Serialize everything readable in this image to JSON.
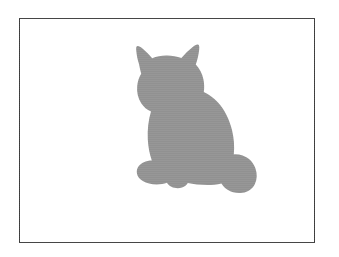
{
  "figure": {
    "width": 339,
    "height": 257,
    "background_color": "#ffffff",
    "caption": ""
  },
  "frame": {
    "name": "image-border",
    "x": 19,
    "y": 18,
    "width": 296,
    "height": 225,
    "border_color": "#3b3b3b",
    "border_width": 1,
    "fill_color": "#ffffff"
  },
  "subject": {
    "label": "cat-silhouette",
    "description": "sitting cat facing left",
    "fill_color": "#919191",
    "bbox": {
      "x": 129,
      "y": 62,
      "width": 98,
      "height": 126
    },
    "parts": [
      "left-ear",
      "right-ear",
      "head",
      "cheek",
      "chest",
      "back",
      "haunch",
      "front-paws",
      "tail"
    ]
  },
  "chart_data": {
    "type": "image",
    "title": "",
    "xlabel": "",
    "ylabel": "",
    "annotations": []
  }
}
